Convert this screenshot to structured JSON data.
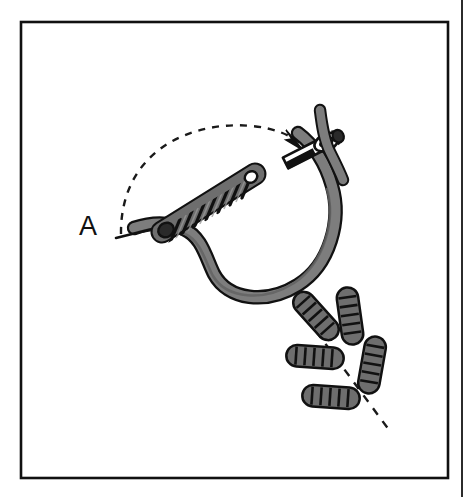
{
  "page": {
    "width": 471,
    "height": 497,
    "background_color": "#ffffff",
    "kind": "line-art-instruction-diagram"
  },
  "frame": {
    "inner_border": {
      "x": 21,
      "y": 22,
      "width": 427,
      "height": 456,
      "stroke_color": "#111111",
      "stroke_width": 2.4,
      "fill": "#ffffff"
    },
    "page_edge_rule": {
      "x": 462,
      "y_start": 0,
      "y_end": 497,
      "stroke_color": "#2b2b2b",
      "stroke_width": 2
    }
  },
  "labels": {
    "step_label": {
      "text": "A",
      "x": 88,
      "y": 228,
      "font_size": 27,
      "color": "#111111"
    }
  },
  "colors": {
    "outline": "#111111",
    "thread_gray": "#7d7d7d",
    "thread_gray_dark": "#636363",
    "knot_gray": "#6e6e6e",
    "knot_gray_light": "#8a8a8a",
    "needle_white": "#ffffff",
    "needle_black": "#111111",
    "paper_white": "#ffffff",
    "dash_color": "#1a1a1a"
  },
  "elements": {
    "thread_loop": {
      "name": "thread-loop",
      "description": "large gray looped thread forming an open oval, black outlined",
      "path": "M 130 227 C 150 222 168 222 182 228 C 205 238 205 262 214 276 C 232 300 270 300 300 280 C 330 260 340 216 330 184 C 322 158 308 142 296 134",
      "stroke_color": "#7d7d7d",
      "stroke_width": 11,
      "outline_color": "#111111",
      "outline_width": 14
    },
    "thread_tail": {
      "name": "thread-tail",
      "description": "thin black thread tail extending to the left out of the coil",
      "path": "M 118 236 L 172 224",
      "stroke_color": "#111111",
      "stroke_width": 2.4
    },
    "coil_stitch": {
      "name": "coil-twist-stitch",
      "description": "twisted / wrapped coil of thread lying along the upper side of the loop",
      "start": [
        164,
        222
      ],
      "end": [
        252,
        176
      ],
      "wrap_count": 8,
      "fill_color": "#6e6e6e",
      "outline_color": "#111111"
    },
    "dashed_arc": {
      "name": "dashed-motion-arc",
      "description": "dashed arc with arrowhead indicating direction the needle travels",
      "path": "M 120 232 C 122 150 190 122 252 128 C 272 130 288 136 298 143",
      "stroke_color": "#1a1a1a",
      "stroke_width": 2.2,
      "dash_pattern": "7 7",
      "arrow_tip": [
        300,
        147
      ],
      "arrow_angle_deg": 38
    },
    "needle": {
      "name": "sewing-needle",
      "description": "white needle with black tip, eye at upper right, thread passing through eye",
      "tip": [
        288,
        158
      ],
      "eye_center": [
        330,
        136
      ],
      "angle_deg": -28,
      "body_length": 56,
      "body_width": 12,
      "fill_color": "#ffffff",
      "outline_color": "#111111",
      "shaded_tip_color": "#111111"
    },
    "bullion_knots": {
      "name": "bullion-knot-cluster",
      "description": "five finished bullion knots arranged like a leaf spray about a dashed guideline",
      "fill_color": "#6e6e6e",
      "outline_color": "#111111",
      "knots": [
        {
          "id": "knot-upper-left",
          "x1": 296,
          "y1": 292,
          "x2": 337,
          "y2": 340,
          "segments": 6
        },
        {
          "id": "knot-upper-right",
          "x1": 354,
          "y1": 291,
          "x2": 346,
          "y2": 341,
          "segments": 6
        },
        {
          "id": "knot-middle-left",
          "x1": 288,
          "y1": 355,
          "x2": 342,
          "y2": 359,
          "segments": 6
        },
        {
          "id": "knot-right",
          "x1": 377,
          "y1": 337,
          "x2": 366,
          "y2": 392,
          "segments": 6
        },
        {
          "id": "knot-lower-left",
          "x1": 304,
          "y1": 395,
          "x2": 358,
          "y2": 399,
          "segments": 6
        }
      ]
    },
    "guide_dashed_line": {
      "name": "dashed-guideline",
      "description": "dashed construction line running diagonally down-right through the knot cluster",
      "path": "M 316 331 L 392 434",
      "stroke_color": "#1a1a1a",
      "stroke_width": 2.2,
      "dash_pattern": "8 8"
    }
  }
}
